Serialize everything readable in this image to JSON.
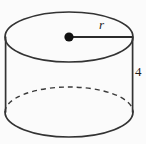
{
  "figure": {
    "type": "geometry-diagram",
    "shape": "cylinder",
    "background_color": "#fbfbfb",
    "stroke_color": "#333333",
    "dot_color": "#111111",
    "labels": {
      "radius": "r",
      "height": "4"
    },
    "parts": {
      "top_ellipse_name": "top-face-ellipse",
      "bottom_front_arc_name": "bottom-front-arc",
      "bottom_back_arc_name": "bottom-back-arc-dashed",
      "left_side_name": "left-side-edge",
      "right_side_name": "right-side-edge",
      "center_dot_name": "center-point-dot",
      "radius_segment_name": "radius-segment"
    },
    "geometry": {
      "top_center_x": 69,
      "top_center_y": 37,
      "radius_x": 64,
      "radius_y": 25,
      "bottom_center_y": 112,
      "left_edge_x": 5,
      "right_edge_x": 133
    }
  }
}
